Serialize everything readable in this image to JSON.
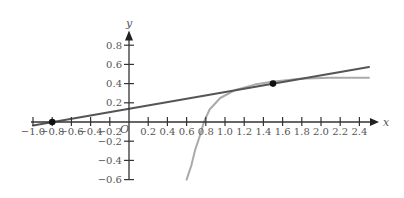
{
  "chart_data": {
    "type": "line",
    "title": "",
    "xlabel": "x",
    "ylabel": "y",
    "origin_label": "O",
    "xlim": [
      -1.0,
      2.5
    ],
    "ylim": [
      -0.6,
      0.9
    ],
    "grid": false,
    "legend": null,
    "x_ticks": [
      -1.0,
      -0.8,
      -0.6,
      -0.4,
      -0.2,
      0.2,
      0.4,
      0.6,
      0.8,
      1.0,
      1.2,
      1.4,
      1.6,
      1.8,
      2.0,
      2.2,
      2.4
    ],
    "x_tick_labels": [
      "−1.0",
      "−0.8",
      "−0.6",
      "−0.4",
      "−0.2",
      "0.2",
      "0.4",
      "0.6",
      "0.8",
      "1.0",
      "1.2",
      "1.4",
      "1.6",
      "1.8",
      "2.0",
      "2.2",
      "2.4"
    ],
    "y_ticks": [
      0.8,
      0.6,
      0.4,
      0.2,
      -0.2,
      -0.4,
      -0.6
    ],
    "y_tick_labels": [
      "0.8",
      "0.6",
      "0.4",
      "0.2",
      "−0.2",
      "−0.4",
      "−0.6"
    ],
    "series": [
      {
        "name": "tangent line",
        "color": "#555555",
        "width": 2,
        "x": [
          -1.0,
          2.5
        ],
        "y": [
          -0.035,
          0.574
        ]
      },
      {
        "name": "curve",
        "color": "#aaaaaa",
        "width": 2,
        "x": [
          0.6,
          0.65,
          0.69,
          0.74,
          0.78,
          0.84,
          0.95,
          1.1,
          1.31,
          1.49,
          1.78,
          2.09,
          2.5
        ],
        "y": [
          -0.6,
          -0.45,
          -0.29,
          -0.14,
          0.0,
          0.13,
          0.25,
          0.33,
          0.39,
          0.42,
          0.45,
          0.46,
          0.46
        ]
      }
    ],
    "points": [
      {
        "x": -0.8,
        "y": 0.0,
        "label": "x-intercept of tangent"
      },
      {
        "x": 1.5,
        "y": 0.4,
        "label": "point of tangency"
      }
    ]
  },
  "layout": {
    "origin_px": [
      129,
      122
    ],
    "px_per_unit": 96
  }
}
